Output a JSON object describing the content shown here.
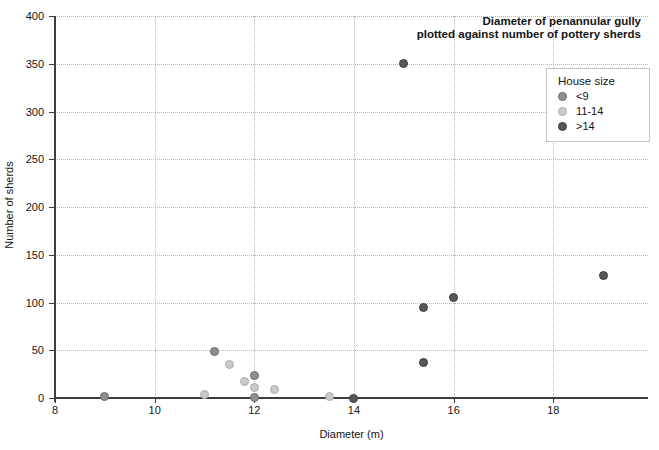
{
  "colors": {
    "background": "#ffffff",
    "axis": "#3d3d3d",
    "grid": "#b8b8b8",
    "text": "#141414",
    "legend_border": "#c4c4c4"
  },
  "chart_data": {
    "type": "scatter",
    "title": "Diameter of penannular gully plotted against number of pottery sherds",
    "title_line1": "Diameter of penannular gully",
    "title_line2": "plotted against number of pottery sherds",
    "xlabel": "Diameter (m)",
    "ylabel": "Number of sherds",
    "xlim": [
      8,
      19.9
    ],
    "ylim": [
      0,
      400
    ],
    "x_ticks": [
      8,
      10,
      12,
      14,
      16,
      18
    ],
    "y_ticks": [
      0,
      50,
      100,
      150,
      200,
      250,
      300,
      350,
      400
    ],
    "grid": "dotted",
    "legend": {
      "title": "House size",
      "position": "top-right"
    },
    "series": [
      {
        "name": "<9",
        "fill": "#8e8e8e",
        "stroke": "#6a6a6a",
        "points": [
          [
            9,
            2
          ],
          [
            11.2,
            49
          ],
          [
            12,
            24
          ],
          [
            12,
            1
          ]
        ]
      },
      {
        "name": "11-14",
        "fill": "#cacaca",
        "stroke": "#ababab",
        "points": [
          [
            11,
            4
          ],
          [
            11.5,
            35
          ],
          [
            11.8,
            17
          ],
          [
            12,
            11
          ],
          [
            12.4,
            9
          ],
          [
            13.5,
            2
          ]
        ]
      },
      {
        "name": ">14",
        "fill": "#575757",
        "stroke": "#3c3c3c",
        "points": [
          [
            14,
            0
          ],
          [
            15,
            350
          ],
          [
            15.4,
            95
          ],
          [
            15.4,
            37
          ],
          [
            16,
            105
          ],
          [
            19,
            128
          ]
        ]
      }
    ]
  }
}
